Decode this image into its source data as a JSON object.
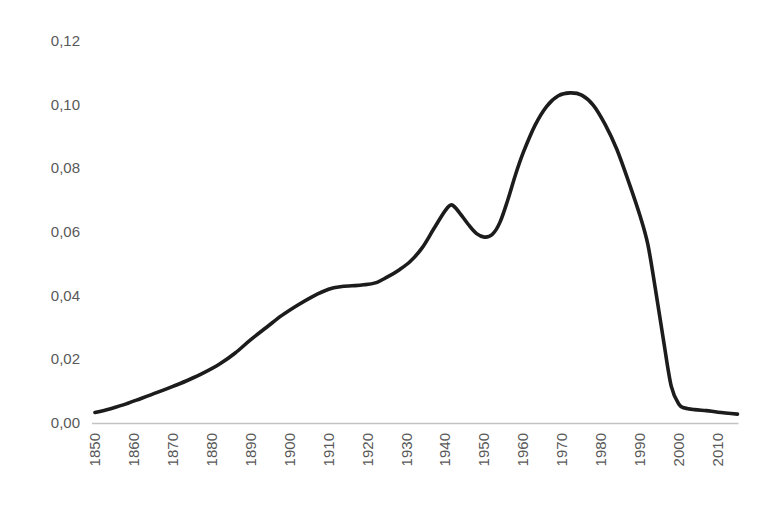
{
  "chart_data": {
    "type": "line",
    "title": "",
    "xlabel": "",
    "ylabel": "",
    "grid": false,
    "legend_position": "none",
    "background_color": "#ffffff",
    "text_color": "#595959",
    "axis_line_color": "#c3c3c3",
    "x_range": [
      1850,
      2015
    ],
    "ylim": [
      0,
      0.12
    ],
    "decimal_separator": ",",
    "ytick_values": [
      0,
      0.02,
      0.04,
      0.06,
      0.08,
      0.1,
      0.12
    ],
    "ytick_labels": [
      "0,00",
      "0,02",
      "0,04",
      "0,06",
      "0,08",
      "0,10",
      "0,12"
    ],
    "xtick_years": [
      1850,
      1860,
      1870,
      1880,
      1890,
      1900,
      1910,
      1920,
      1930,
      1940,
      1950,
      1960,
      1970,
      1980,
      1990,
      2000,
      2010
    ],
    "xtick_labels": [
      "1850",
      "1860",
      "1870",
      "1880",
      "1890",
      "1900",
      "1910",
      "1920",
      "1930",
      "1940",
      "1950",
      "1960",
      "1970",
      "1980",
      "1990",
      "2000",
      "2010"
    ],
    "xtick_label_rotation_deg": -90,
    "series": [
      {
        "name": "curve",
        "color": "#1c1c1c",
        "stroke_width": 3.6,
        "points": [
          [
            1850,
            0.0033
          ],
          [
            1854,
            0.0045
          ],
          [
            1858,
            0.006
          ],
          [
            1862,
            0.0078
          ],
          [
            1866,
            0.0096
          ],
          [
            1870,
            0.0115
          ],
          [
            1874,
            0.0135
          ],
          [
            1878,
            0.0158
          ],
          [
            1882,
            0.0185
          ],
          [
            1886,
            0.022
          ],
          [
            1890,
            0.0262
          ],
          [
            1894,
            0.03
          ],
          [
            1898,
            0.0338
          ],
          [
            1902,
            0.037
          ],
          [
            1906,
            0.0398
          ],
          [
            1910,
            0.042
          ],
          [
            1913,
            0.0428
          ],
          [
            1916,
            0.0431
          ],
          [
            1919,
            0.0434
          ],
          [
            1922,
            0.044
          ],
          [
            1925,
            0.0458
          ],
          [
            1928,
            0.048
          ],
          [
            1931,
            0.0508
          ],
          [
            1934,
            0.055
          ],
          [
            1937,
            0.061
          ],
          [
            1940,
            0.0668
          ],
          [
            1941.5,
            0.0685
          ],
          [
            1943,
            0.067
          ],
          [
            1946,
            0.0622
          ],
          [
            1948,
            0.0595
          ],
          [
            1950,
            0.0584
          ],
          [
            1952,
            0.0592
          ],
          [
            1954,
            0.063
          ],
          [
            1956,
            0.07
          ],
          [
            1958,
            0.078
          ],
          [
            1960,
            0.085
          ],
          [
            1963,
            0.0935
          ],
          [
            1966,
            0.0995
          ],
          [
            1969,
            0.1028
          ],
          [
            1972,
            0.1037
          ],
          [
            1975,
            0.103
          ],
          [
            1978,
            0.0998
          ],
          [
            1981,
            0.0938
          ],
          [
            1984,
            0.086
          ],
          [
            1987,
            0.076
          ],
          [
            1990,
            0.065
          ],
          [
            1992,
            0.056
          ],
          [
            1994,
            0.0415
          ],
          [
            1996,
            0.026
          ],
          [
            1998,
            0.0115
          ],
          [
            2000,
            0.0058
          ],
          [
            2001.5,
            0.0047
          ],
          [
            2004,
            0.0042
          ],
          [
            2007,
            0.0039
          ],
          [
            2010,
            0.0034
          ],
          [
            2015,
            0.0028
          ]
        ]
      }
    ]
  },
  "layout_hints": {
    "plot_left_px": 95,
    "plot_right_px": 718,
    "baseline_y_px": 423,
    "y_top_px": 41
  }
}
